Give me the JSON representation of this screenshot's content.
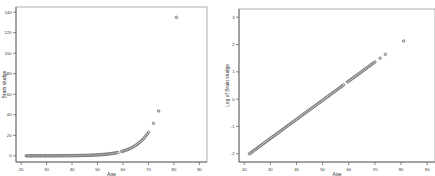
{
  "chart_data": [
    {
      "type": "scatter",
      "title": "",
      "xlabel": "Age",
      "ylabel": "Brain sludge",
      "xlim": [
        18,
        93
      ],
      "ylim": [
        -6,
        145
      ],
      "xticks": [
        20,
        30,
        40,
        50,
        60,
        70,
        80,
        90
      ],
      "yticks": [
        0,
        20,
        40,
        60,
        80,
        100,
        120,
        140
      ],
      "grid": false,
      "legend": null,
      "transform": "linear",
      "points_source": "exp10(-2 + 0.07*(age-22))",
      "x": [],
      "y": []
    },
    {
      "type": "scatter",
      "title": "",
      "xlabel": "Age",
      "ylabel": "Log of Brain sludge",
      "xlim": [
        18,
        93
      ],
      "ylim": [
        -2.3,
        3.3
      ],
      "xticks": [
        20,
        30,
        40,
        50,
        60,
        70,
        80,
        90
      ],
      "yticks": [
        -2,
        -1,
        0,
        1,
        2,
        3
      ],
      "grid": false,
      "legend": null,
      "transform": "log10",
      "points_source": "-2 + 0.07*(age-22)",
      "x": [],
      "y": []
    }
  ],
  "ages": [
    22,
    22.5,
    23,
    23.5,
    24,
    24.5,
    25,
    25.5,
    26,
    26.5,
    27,
    27.5,
    28,
    28.5,
    29,
    29.5,
    30,
    30.5,
    31,
    31.5,
    32,
    32.5,
    33,
    33.5,
    34,
    34.5,
    35,
    35.5,
    36,
    36.5,
    37,
    37.5,
    38,
    38.5,
    39,
    39.5,
    40,
    40.5,
    41,
    41.5,
    42,
    42.5,
    43,
    43.5,
    44,
    44.5,
    45,
    45.5,
    46,
    46.5,
    47,
    47.5,
    48,
    48.5,
    49,
    49.5,
    50,
    50.5,
    51,
    51.5,
    52,
    52.5,
    53,
    53.5,
    54,
    54.5,
    55,
    55.5,
    56,
    56.5,
    57,
    57.5,
    58,
    59.5,
    60,
    60.5,
    61,
    61.5,
    62,
    62.5,
    63,
    63.5,
    64,
    64.5,
    65,
    65.5,
    66,
    66.5,
    67,
    67.5,
    68,
    68.5,
    69,
    69.5,
    70,
    72,
    74,
    81
  ],
  "style": {
    "marker_fill": "#d8d8d8",
    "marker_stroke": "#444444",
    "axis_color": "#555555",
    "frame_color": "#999999"
  }
}
